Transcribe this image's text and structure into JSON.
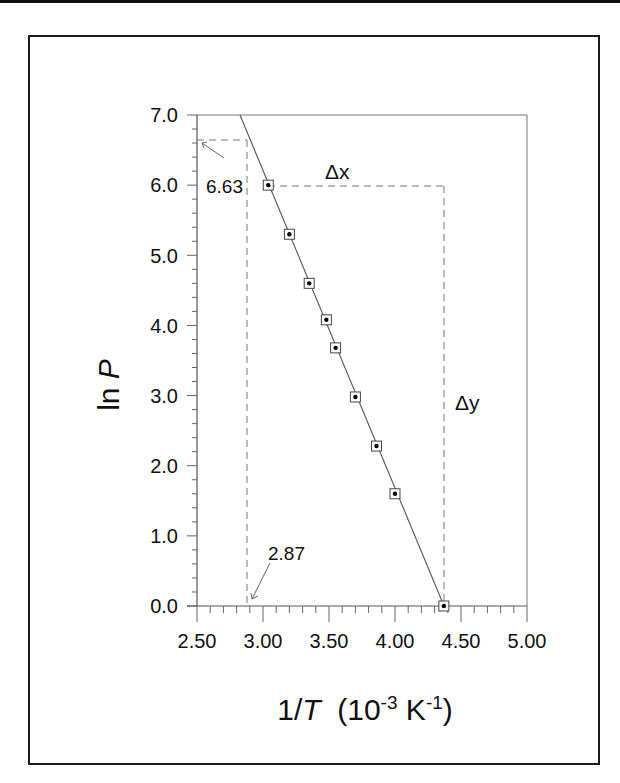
{
  "chart_data": {
    "type": "scatter",
    "title": "",
    "xlabel": "1/T (10^-3 K^-1)",
    "ylabel": "ln P",
    "xlim": [
      2.5,
      5.0
    ],
    "ylim": [
      0.0,
      7.0
    ],
    "x_ticks": [
      "2.50",
      "3.00",
      "3.50",
      "4.00",
      "4.50",
      "5.00"
    ],
    "y_ticks": [
      "0.0",
      "1.0",
      "2.0",
      "3.0",
      "4.0",
      "5.0",
      "6.0",
      "7.0"
    ],
    "grid": false,
    "series": [
      {
        "name": "data",
        "marker": "square-with-dot",
        "x": [
          3.04,
          3.2,
          3.35,
          3.48,
          3.55,
          3.7,
          3.86,
          4.0,
          4.37
        ],
        "y": [
          6.0,
          5.3,
          4.6,
          4.08,
          3.68,
          2.98,
          2.28,
          1.6,
          0.0
        ]
      },
      {
        "name": "linear fit",
        "type": "line",
        "x": [
          2.83,
          4.37
        ],
        "y": [
          7.0,
          0.0
        ]
      }
    ],
    "annotations": [
      {
        "text": "6.63",
        "points_to": [
          2.5,
          6.63
        ]
      },
      {
        "text": "2.87",
        "points_to": [
          2.87,
          0.0
        ]
      },
      {
        "text": "Δx",
        "between": [
          [
            3.04,
            6.0
          ],
          [
            4.37,
            6.0
          ]
        ]
      },
      {
        "text": "Δy",
        "between": [
          [
            4.37,
            6.0
          ],
          [
            4.37,
            0.0
          ]
        ]
      }
    ]
  },
  "labels": {
    "x_title_main": "1/",
    "x_title_italic": "T",
    "x_title_open": "  (10",
    "x_title_exp1": "-3",
    "x_title_mid": " K",
    "x_title_exp2": "-1",
    "x_title_close": ")",
    "y_title_main": "ln ",
    "y_title_italic": "P",
    "anno_663": "6.63",
    "anno_287": "2.87",
    "delta_x": "Δx",
    "delta_y": "Δy",
    "xt0": "2.50",
    "xt1": "3.00",
    "xt2": "3.50",
    "xt3": "4.00",
    "xt4": "4.50",
    "xt5": "5.00",
    "yt0": "0.0",
    "yt1": "1.0",
    "yt2": "2.0",
    "yt3": "3.0",
    "yt4": "4.0",
    "yt5": "5.0",
    "yt6": "6.0",
    "yt7": "7.0"
  }
}
